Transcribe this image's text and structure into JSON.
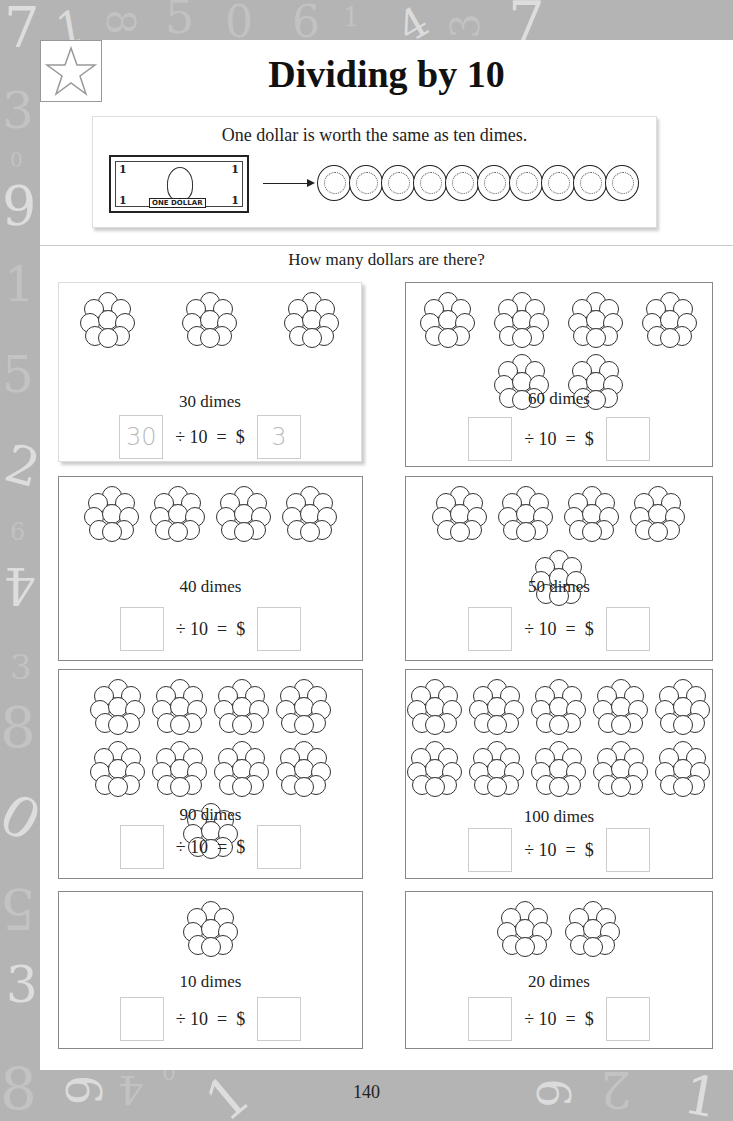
{
  "page": {
    "title": "Dividing by 10",
    "icon": "star-icon",
    "intro": {
      "text": "One dollar is worth the same as ten dimes.",
      "bill_label": "ONE DOLLAR",
      "bill_denomination": "1",
      "dime_count": 10
    },
    "question": "How many dollars are there?",
    "divisor_text": "÷ 10  =  $",
    "page_number": "140"
  },
  "problems": [
    {
      "label": "30 dimes",
      "clusters": 3,
      "dividend_answer": "30",
      "dollar_answer": "3",
      "example": true
    },
    {
      "label": "60 dimes",
      "clusters": 6,
      "dividend_answer": "",
      "dollar_answer": "",
      "example": false
    },
    {
      "label": "40 dimes",
      "clusters": 4,
      "dividend_answer": "",
      "dollar_answer": "",
      "example": false
    },
    {
      "label": "50 dimes",
      "clusters": 5,
      "dividend_answer": "",
      "dollar_answer": "",
      "example": false
    },
    {
      "label": "90 dimes",
      "clusters": 9,
      "dividend_answer": "",
      "dollar_answer": "",
      "example": false
    },
    {
      "label": "100 dimes",
      "clusters": 10,
      "dividend_answer": "",
      "dollar_answer": "",
      "example": false
    },
    {
      "label": "10 dimes",
      "clusters": 1,
      "dividend_answer": "",
      "dollar_answer": "",
      "example": false
    },
    {
      "label": "20 dimes",
      "clusters": 2,
      "dividend_answer": "",
      "dollar_answer": "",
      "example": false
    }
  ],
  "background_digits": [
    "7",
    "1",
    "8",
    "5",
    "0",
    "6",
    "1",
    "4",
    "3",
    "7",
    "3",
    "0",
    "9",
    "1",
    "5",
    "2",
    "6",
    "4",
    "3",
    "8",
    "0",
    "5",
    "3",
    "8",
    "6",
    "4",
    "0",
    "1",
    "9",
    "2",
    "1"
  ]
}
